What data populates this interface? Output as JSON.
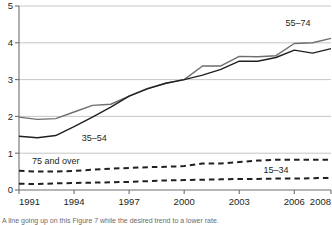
{
  "chart_data": {
    "type": "line",
    "title": "",
    "subtitle": "",
    "xlabel": "",
    "ylabel": "",
    "xlim": [
      1991,
      2008
    ],
    "ylim": [
      0,
      5
    ],
    "yticks": [
      0,
      1,
      2,
      3,
      4,
      5
    ],
    "ytick_labels": [
      "0",
      "1",
      "2",
      "3",
      "4",
      "5"
    ],
    "xticks": [
      1991,
      1994,
      1997,
      2000,
      2003,
      2006,
      2008
    ],
    "xtick_labels": [
      "1991",
      "1994",
      "1997",
      "2000",
      "2003",
      "2006",
      "2008"
    ],
    "grid": "horizontal",
    "legend_position": "inline-annotations",
    "x": [
      1991,
      1992,
      1993,
      1994,
      1995,
      1996,
      1997,
      1998,
      1999,
      2000,
      2001,
      2002,
      2003,
      2004,
      2005,
      2006,
      2007,
      2008
    ],
    "series": [
      {
        "name": "55–74",
        "style": "solid",
        "color": "#6d6e71",
        "label_x": 2006.2,
        "label_y": 4.45,
        "values": [
          1.98,
          1.92,
          1.94,
          2.12,
          2.3,
          2.33,
          2.55,
          2.76,
          2.9,
          3.0,
          3.37,
          3.37,
          3.63,
          3.62,
          3.65,
          3.98,
          4.0,
          4.12
        ]
      },
      {
        "name": "35–54",
        "style": "solid",
        "color": "#231f20",
        "label_x": 1995.1,
        "label_y": 1.32,
        "values": [
          1.46,
          1.42,
          1.48,
          1.72,
          1.98,
          2.25,
          2.55,
          2.75,
          2.9,
          3.0,
          3.12,
          3.28,
          3.5,
          3.5,
          3.6,
          3.8,
          3.72,
          3.84
        ]
      },
      {
        "name": "75 and over",
        "style": "dashed",
        "color": "#231f20",
        "label_x": 1993.0,
        "label_y": 0.72,
        "values": [
          0.52,
          0.5,
          0.5,
          0.52,
          0.55,
          0.58,
          0.6,
          0.62,
          0.63,
          0.65,
          0.72,
          0.72,
          0.76,
          0.8,
          0.82,
          0.82,
          0.82,
          0.82
        ]
      },
      {
        "name": "15–34",
        "style": "dashed",
        "color": "#231f20",
        "label_x": 2005.0,
        "label_y": 0.45,
        "values": [
          0.17,
          0.16,
          0.18,
          0.19,
          0.2,
          0.21,
          0.22,
          0.24,
          0.26,
          0.27,
          0.28,
          0.29,
          0.3,
          0.3,
          0.31,
          0.31,
          0.32,
          0.33
        ]
      }
    ]
  },
  "footnote": {
    "text": "A line going up on this Figure 7 while the desired trend to a lower rate."
  },
  "colors": {
    "axis": "#6d6e71",
    "grid": "#b8b8b8",
    "text": "#231f20",
    "series_light": "#6d6e71",
    "series_dark": "#231f20"
  }
}
